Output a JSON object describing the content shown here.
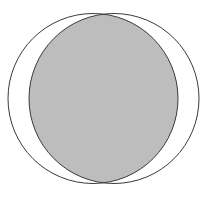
{
  "diagram": {
    "type": "venn-intersection",
    "circles": [
      {
        "name": "left-circle",
        "cx": 93,
        "cy": 98.5,
        "r": 85
      },
      {
        "name": "right-circle",
        "cx": 114,
        "cy": 98.5,
        "r": 85
      }
    ],
    "colors": {
      "background": "#ffffff",
      "stroke": "#3a3a3a",
      "intersection_fill": "#bdbdbd"
    },
    "stroke_width": 1,
    "shaded_region": "intersection"
  }
}
